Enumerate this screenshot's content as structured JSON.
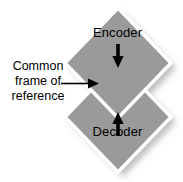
{
  "diagram": {
    "background_color": "#ffffff",
    "shape_fill": "#999999",
    "shape_outline": "#ffffff",
    "shadow_color": "#c9c9c9",
    "text_color": "#000000",
    "arrow_color": "#000000"
  },
  "nodes": {
    "encoder": {
      "label": "Encoder",
      "direction_icon": "arrow-down-icon"
    },
    "decoder": {
      "label": "Decoder",
      "direction_icon": "arrow-up-icon"
    }
  },
  "caption": {
    "line1": "Common",
    "line2": "frame of",
    "line3": "reference",
    "pointer_icon": "arrow-right-icon"
  }
}
